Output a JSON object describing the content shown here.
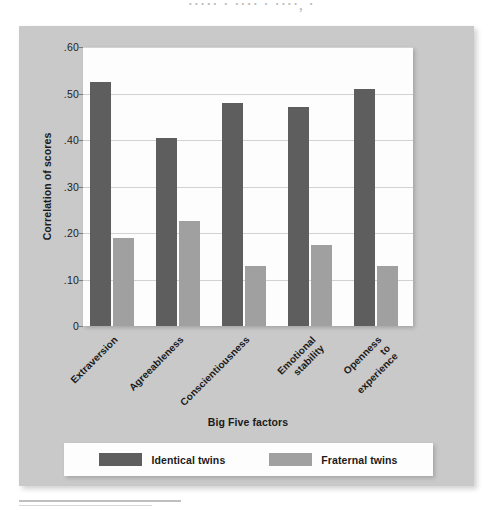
{
  "scan": {
    "top_artifact_text": "·····  ·  ···· ·  ····,  ·"
  },
  "chart_data": {
    "type": "bar",
    "title": "",
    "xlabel": "Big Five factors",
    "ylabel": "Correlation of scores",
    "categories": [
      "Extraversion",
      "Agreeableness",
      "Conscientiousness",
      "Emotional\nstability",
      "Openness\nto\nexperience"
    ],
    "category_lines": [
      [
        "Extraversion"
      ],
      [
        "Agreeableness"
      ],
      [
        "Conscientiousness"
      ],
      [
        "Emotional",
        "stability"
      ],
      [
        "Openness",
        "to",
        "experience"
      ]
    ],
    "series": [
      {
        "name": "Identical twins",
        "color": "#5e5e5e",
        "values": [
          0.525,
          0.405,
          0.48,
          0.47,
          0.51
        ]
      },
      {
        "name": "Fraternal twins",
        "color": "#a0a0a0",
        "values": [
          0.19,
          0.225,
          0.13,
          0.175,
          0.13
        ]
      }
    ],
    "ylim": [
      0,
      0.6
    ],
    "yticks": [
      0,
      0.1,
      0.2,
      0.3,
      0.4,
      0.5,
      0.6
    ],
    "ytick_labels": [
      "0",
      ".10",
      ".20",
      ".30",
      ".40",
      ".50",
      ".60"
    ],
    "grid": true,
    "legend_position": "bottom"
  },
  "legend": {
    "entries": [
      {
        "label": "Identical twins",
        "color": "#5e5e5e"
      },
      {
        "label": "Fraternal twins",
        "color": "#a0a0a0"
      }
    ]
  },
  "colors": {
    "panel_background": "#c9c9c9",
    "plot_background": "#fdfdfd",
    "gridline": "#d2d2d2",
    "text": "#1a1a1a",
    "identical_twins": "#5e5e5e",
    "fraternal_twins": "#a0a0a0"
  }
}
